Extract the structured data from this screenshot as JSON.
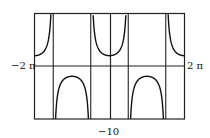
{
  "chart_data": {
    "type": "line",
    "title": "",
    "function": "sec(x)",
    "xlabel": "",
    "ylabel": "",
    "x_range_labels": {
      "left": "-2 π",
      "right": "2 π"
    },
    "bottom_label": "-10",
    "xlim": [
      -6.2832,
      6.2832
    ],
    "asymptotes": [
      -4.7124,
      -1.5708,
      1.5708,
      4.7124
    ],
    "grid": false,
    "series": [
      {
        "name": "sec(x)",
        "color": "#111111",
        "branches": [
          {
            "x": [
              -6.28,
              -5.5,
              -5.0,
              -4.8
            ],
            "y": [
              1.0,
              1.41,
              3.53,
              11.5
            ]
          },
          {
            "x": [
              -4.6,
              -3.1416,
              -1.7
            ],
            "y": [
              -8.9,
              -1.0,
              -7.7
            ]
          },
          {
            "x": [
              -1.45,
              0,
              1.45
            ],
            "y": [
              8.4,
              1.0,
              8.4
            ]
          },
          {
            "x": [
              1.7,
              3.1416,
              4.6
            ],
            "y": [
              -7.7,
              -1.0,
              -8.9
            ]
          },
          {
            "x": [
              4.8,
              5.0,
              5.5,
              6.28
            ],
            "y": [
              11.5,
              3.53,
              1.41,
              1.0
            ]
          }
        ]
      }
    ]
  },
  "labels": {
    "left": "−2 π",
    "right": "2 π",
    "bottom": "−10"
  }
}
